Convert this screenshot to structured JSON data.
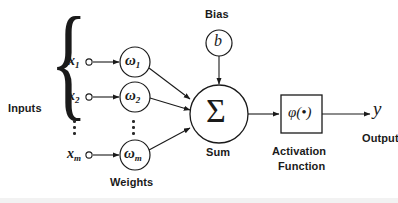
{
  "diagram": {
    "type": "neural-network-neuron",
    "background_color": "#ffffff",
    "stroke_color": "#1a1a1a",
    "labels": {
      "inputs": "Inputs",
      "weights": "Weights",
      "bias": "Bias",
      "sum": "Sum",
      "activation_line1": "Activation",
      "activation_line2": "Function",
      "output": "Output"
    },
    "inputs": [
      {
        "base": "x",
        "sub": "1"
      },
      {
        "base": "x",
        "sub": "2"
      },
      {
        "base": "x",
        "sub": "m"
      }
    ],
    "weights": [
      {
        "base": "ω",
        "sub": "1"
      },
      {
        "base": "ω",
        "sub": "2"
      },
      {
        "base": "ω",
        "sub": "m"
      }
    ],
    "bias_symbol": "b",
    "sum_symbol": "Σ",
    "activation_symbol": "φ(•)",
    "output_symbol": "y",
    "ellipsis_symbol": "⋮"
  }
}
